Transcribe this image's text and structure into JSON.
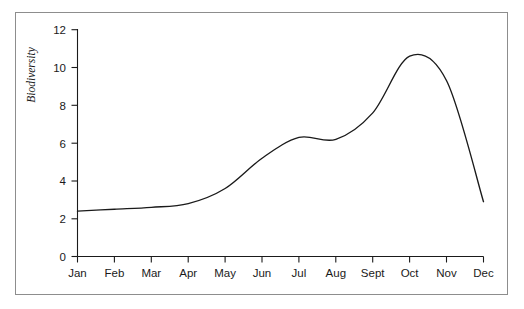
{
  "chart_data": {
    "type": "line",
    "title": "",
    "subtitle": "",
    "xlabel": "",
    "ylabel": "Biodiversity",
    "categories": [
      "Jan",
      "Feb",
      "Mar",
      "Apr",
      "May",
      "Jun",
      "Jul",
      "Aug",
      "Sept",
      "Oct",
      "Nov",
      "Dec"
    ],
    "values": [
      2.4,
      2.5,
      2.6,
      2.8,
      3.6,
      5.2,
      6.3,
      6.2,
      7.6,
      10.6,
      9.3,
      2.9
    ],
    "series": [
      {
        "name": "Biodiversity",
        "values": [
          2.4,
          2.5,
          2.6,
          2.8,
          3.6,
          5.2,
          6.3,
          6.2,
          7.6,
          10.6,
          9.3,
          2.9
        ]
      }
    ],
    "peak": {
      "label": "Oct",
      "value": 10.85
    },
    "ylim": [
      0,
      12
    ],
    "ytick_values": [
      0,
      2,
      4,
      6,
      8,
      10,
      12
    ],
    "ytick_labels": [
      "0",
      "2",
      "4",
      "6",
      "8",
      "10",
      "12"
    ],
    "xtick_labels": [
      "Jan",
      "Feb",
      "Mar",
      "Apr",
      "May",
      "Jun",
      "Jul",
      "Aug",
      "Sept",
      "Oct",
      "Nov",
      "Dec"
    ],
    "grid": false,
    "legend": false,
    "legend_position": "none",
    "line_color": "#1a1a1a",
    "background_color": "#ffffff",
    "border_color": "#8d8d8d",
    "annotations": []
  },
  "axes": {
    "y": {
      "title": "Biodiversity",
      "ticks": [
        {
          "label": "12",
          "value": 12
        },
        {
          "label": "10",
          "value": 10
        },
        {
          "label": "8",
          "value": 8
        },
        {
          "label": "6",
          "value": 6
        },
        {
          "label": "4",
          "value": 4
        },
        {
          "label": "2",
          "value": 2
        },
        {
          "label": "0",
          "value": 0
        }
      ]
    },
    "x": {
      "title": "",
      "ticks": [
        {
          "label": "Jan",
          "index": 0
        },
        {
          "label": "Feb",
          "index": 1
        },
        {
          "label": "Mar",
          "index": 2
        },
        {
          "label": "Apr",
          "index": 3
        },
        {
          "label": "May",
          "index": 4
        },
        {
          "label": "Jun",
          "index": 5
        },
        {
          "label": "Jul",
          "index": 6
        },
        {
          "label": "Aug",
          "index": 7
        },
        {
          "label": "Sept",
          "index": 8
        },
        {
          "label": "Oct",
          "index": 9
        },
        {
          "label": "Nov",
          "index": 10
        },
        {
          "label": "Dec",
          "index": 11
        }
      ]
    }
  }
}
